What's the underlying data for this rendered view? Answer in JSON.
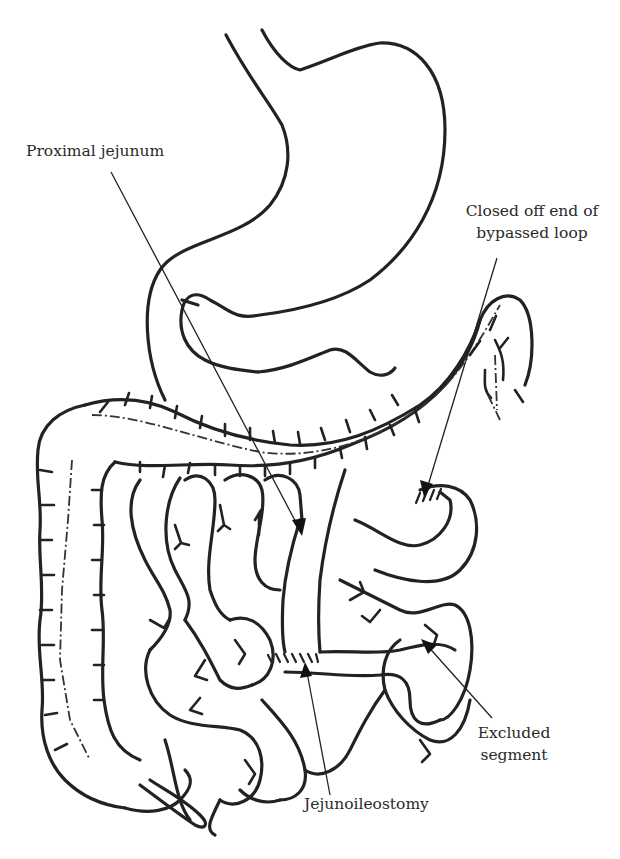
{
  "diagram": {
    "type": "anatomical-illustration",
    "labels": {
      "proximal_jejunum": "Proximal jejunum",
      "closed_off_end_line1": "Closed off end of",
      "closed_off_end_line2": "bypassed loop",
      "excluded_segment_line1": "Excluded",
      "excluded_segment_line2": "segment",
      "jejunoileostomy": "Jejunoileostomy"
    },
    "colors": {
      "line": "#222222",
      "text": "#2a2a2a",
      "background": "#ffffff"
    }
  }
}
